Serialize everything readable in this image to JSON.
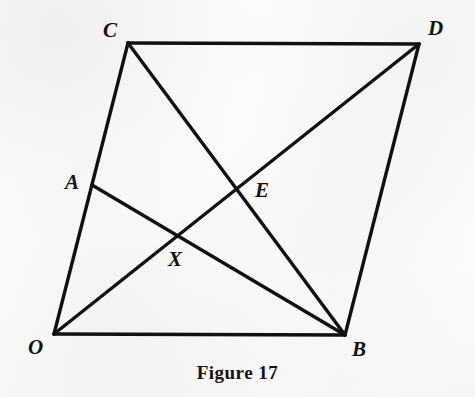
{
  "figure": {
    "caption": "Figure 17",
    "canvas": {
      "width": 475,
      "height": 397
    },
    "colors": {
      "background": "#fcfcfb",
      "ink": "#131110",
      "label": "#14110f"
    },
    "stroke_width": 3.4
  },
  "points": {
    "O": {
      "label": "O",
      "x": 54,
      "y": 334,
      "label_x": 28,
      "label_y": 337
    },
    "B": {
      "label": "B",
      "x": 345,
      "y": 335,
      "label_x": 352,
      "label_y": 339
    },
    "C": {
      "label": "C",
      "x": 128,
      "y": 43,
      "label_x": 103,
      "label_y": 20
    },
    "D": {
      "label": "D",
      "x": 419,
      "y": 44,
      "label_x": 428,
      "label_y": 18
    },
    "A": {
      "label": "A",
      "x": 92,
      "y": 185,
      "label_x": 65,
      "label_y": 172
    },
    "E": {
      "label": "E",
      "x": 238,
      "y": 190,
      "label_x": 255,
      "label_y": 180
    },
    "X": {
      "label": "X",
      "x": 180,
      "y": 238,
      "label_x": 168,
      "label_y": 249
    }
  },
  "segments": [
    {
      "name": "segment-C-D",
      "from": "C",
      "to": "D"
    },
    {
      "name": "segment-O-B",
      "from": "O",
      "to": "B"
    },
    {
      "name": "segment-O-C",
      "from": "O",
      "to": "C"
    },
    {
      "name": "segment-B-D",
      "from": "B",
      "to": "D"
    },
    {
      "name": "segment-C-B",
      "from": "C",
      "to": "B"
    },
    {
      "name": "segment-O-D",
      "from": "O",
      "to": "D"
    },
    {
      "name": "segment-A-B",
      "from": "A",
      "to": "B"
    }
  ],
  "chart_data": {
    "type": "diagram",
    "title": "Figure 17",
    "vertices": [
      "O",
      "B",
      "D",
      "C"
    ],
    "interior_points": [
      "A",
      "E",
      "X"
    ],
    "edges": [
      "C-D",
      "O-B",
      "O-C",
      "B-D",
      "C-B",
      "O-D",
      "A-B"
    ],
    "intersections": [
      {
        "point": "E",
        "of": [
          "O-D",
          "C-B"
        ]
      },
      {
        "point": "X",
        "of": [
          "O-D",
          "A-B"
        ]
      },
      {
        "point": "A",
        "of": [
          "O-C",
          "A-B"
        ]
      }
    ]
  }
}
